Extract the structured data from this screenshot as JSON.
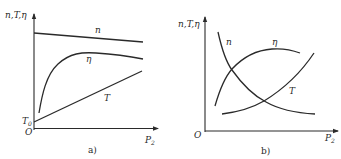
{
  "diagrams": [
    {
      "id": "a",
      "caption": "a)",
      "y_axis_label": "n,T,η",
      "x_axis_label_main": "P",
      "x_axis_label_sub": "2",
      "origin_label": "O",
      "t0_label_main": "T",
      "t0_label_sub": "0",
      "curves": [
        {
          "name": "n",
          "label": "n",
          "shape": "slightly decreasing line"
        },
        {
          "name": "eta",
          "label": "η",
          "shape": "rises sharply, peaks, slightly declines"
        },
        {
          "name": "T",
          "label": "T",
          "shape": "linear increasing from T0"
        }
      ]
    },
    {
      "id": "b",
      "caption": "b)",
      "y_axis_label": "n,T,η",
      "x_axis_label_main": "P",
      "x_axis_label_sub": "2",
      "origin_label": "O",
      "curves": [
        {
          "name": "n",
          "label": "n",
          "shape": "steeply decreasing hyperbolic"
        },
        {
          "name": "eta",
          "label": "η",
          "shape": "rises, peaks, declines"
        },
        {
          "name": "T",
          "label": "T",
          "shape": "increasing, concave up"
        }
      ]
    }
  ]
}
